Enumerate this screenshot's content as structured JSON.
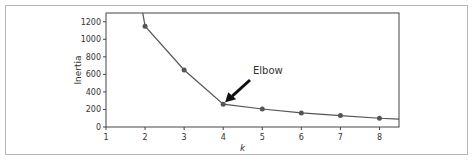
{
  "chart_data": {
    "type": "line",
    "title": "",
    "xlabel": "k",
    "ylabel": "Inertia",
    "x": [
      1,
      2,
      3,
      4,
      5,
      6,
      7,
      8,
      9
    ],
    "series": [
      {
        "name": "Inertia",
        "values": [
          3700,
          1150,
          650,
          260,
          205,
          160,
          130,
          100,
          80
        ]
      }
    ],
    "xticks": [
      1,
      2,
      3,
      4,
      5,
      6,
      7,
      8
    ],
    "yticks": [
      0,
      200,
      400,
      600,
      800,
      1000,
      1200
    ],
    "xlim": [
      1,
      8.5
    ],
    "ylim": [
      0,
      1300
    ],
    "grid": false,
    "legend": null,
    "annotations": [
      {
        "text": "Elbow",
        "x": 4,
        "y": 260,
        "arrow": true
      }
    ]
  },
  "labels": {
    "xlabel": "k",
    "ylabel": "Inertia",
    "annotation": "Elbow"
  }
}
